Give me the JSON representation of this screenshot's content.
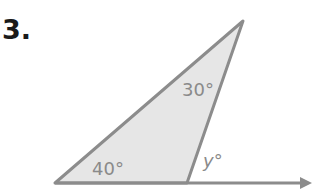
{
  "problem": {
    "number": "3."
  },
  "figure": {
    "type": "triangle-exterior-angle",
    "angles": {
      "bottom_left": "40°",
      "top": "30°",
      "exterior": "y°"
    },
    "colors": {
      "fill": "#e6e6e6",
      "stroke": "#8c8c8c",
      "label": "#8a8a8a"
    }
  }
}
